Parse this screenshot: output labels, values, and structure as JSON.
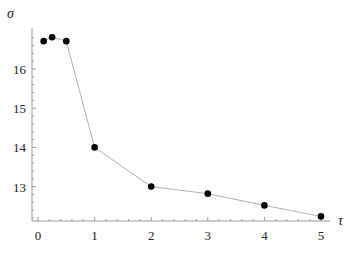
{
  "chart_data": {
    "type": "line",
    "title": "",
    "xlabel": "τ",
    "ylabel": "σ",
    "xlim": [
      -0.1,
      5.15
    ],
    "ylim": [
      12.1,
      16.95
    ],
    "xticks": [
      0,
      1,
      2,
      3,
      4,
      5
    ],
    "yticks": [
      13,
      14,
      15,
      16
    ],
    "grid": false,
    "legend": "none",
    "series": [
      {
        "name": "sigma",
        "color": "#000000",
        "line_color": "#b0b0b0",
        "x": [
          0.1,
          0.25,
          0.5,
          1,
          2,
          3,
          4,
          5
        ],
        "y": [
          16.71,
          16.81,
          16.71,
          14.0,
          13.0,
          12.82,
          12.52,
          12.24
        ]
      }
    ]
  }
}
